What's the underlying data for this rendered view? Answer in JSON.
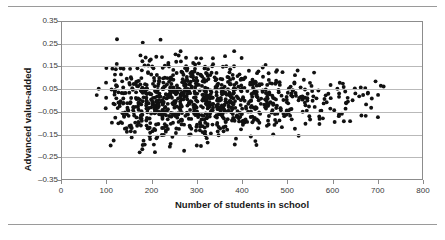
{
  "figure": {
    "has_top_rule": true,
    "has_bottom_rule": true,
    "background_color": "#ffffff",
    "rule_color": "#9a9a9a"
  },
  "chart_data": {
    "type": "scatter",
    "title": "",
    "subtitle": "",
    "xlabel": "Number of students in school",
    "ylabel": "Advanced value-added",
    "xlim": [
      0,
      800
    ],
    "ylim": [
      -0.35,
      0.35
    ],
    "xticks": [
      0,
      100,
      200,
      300,
      400,
      500,
      600,
      700,
      800
    ],
    "xtick_labels": [
      "0",
      "100",
      "200",
      "300",
      "400",
      "500",
      "600",
      "700",
      "800"
    ],
    "yticks": [
      0.35,
      0.25,
      0.15,
      0.05,
      -0.05,
      -0.15,
      -0.25,
      -0.35
    ],
    "ytick_labels": [
      "0.35",
      "0.25",
      "0.15",
      "0.05",
      "–0.05",
      "–0.15",
      "–0.25",
      "–0.35"
    ],
    "grid": {
      "horizontal": true,
      "vertical": false,
      "color": "#b9b9b9"
    },
    "legend": {
      "visible": false,
      "position": "none"
    },
    "marker": {
      "shape": "circle",
      "color": "#111111",
      "size_px": 3.9
    },
    "n_points": 1000,
    "series": [
      {
        "name": "schools",
        "description": "Advanced value-added score by school enrolment; dense heteroscedastic cloud centred near 0 that narrows as enrolment rises.",
        "x_center": 310,
        "y_center": 0.0,
        "y_spread_at_small_n": 0.105,
        "y_spread_at_large_n": 0.055,
        "x_distribution": "right-skewed, mode near 300",
        "x_range_observed": [
          5,
          715
        ],
        "y_range_observed": [
          -0.24,
          0.3
        ]
      }
    ]
  },
  "axes": {
    "x_title": "Number of students in school",
    "y_title": "Advanced value-added"
  }
}
